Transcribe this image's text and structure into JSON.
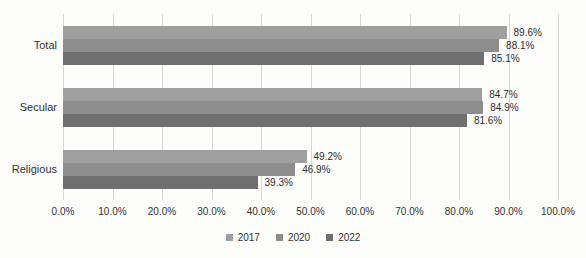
{
  "chart_data": {
    "type": "bar",
    "orientation": "horizontal",
    "title": "",
    "categories": [
      "Total",
      "Secular",
      "Religious"
    ],
    "series": [
      {
        "name": "2017",
        "color": "#9f9f9f",
        "values": [
          89.6,
          84.7,
          49.2
        ]
      },
      {
        "name": "2020",
        "color": "#8d8d8d",
        "values": [
          88.1,
          84.9,
          46.9
        ]
      },
      {
        "name": "2022",
        "color": "#6f6f6f",
        "values": [
          85.1,
          81.6,
          39.3
        ]
      }
    ],
    "data_labels": [
      [
        "89.6%",
        "84.7%",
        "49.2%"
      ],
      [
        "88.1%",
        "84.9%",
        "46.9%"
      ],
      [
        "85.1%",
        "81.6%",
        "39.3%"
      ]
    ],
    "x_axis": {
      "min": 0,
      "max": 100,
      "step": 10,
      "tick_labels": [
        "0.0%",
        "10.0%",
        "20.0%",
        "30.0%",
        "40.0%",
        "50.0%",
        "60.0%",
        "70.0%",
        "80.0%",
        "90.0%",
        "100.0%"
      ],
      "grid": true
    },
    "legend": {
      "position": "bottom",
      "entries": [
        "2017",
        "2020",
        "2022"
      ]
    }
  },
  "colors": {
    "gridline": "#d8d8d6",
    "background": "#fdfdfc",
    "text": "#333333"
  }
}
